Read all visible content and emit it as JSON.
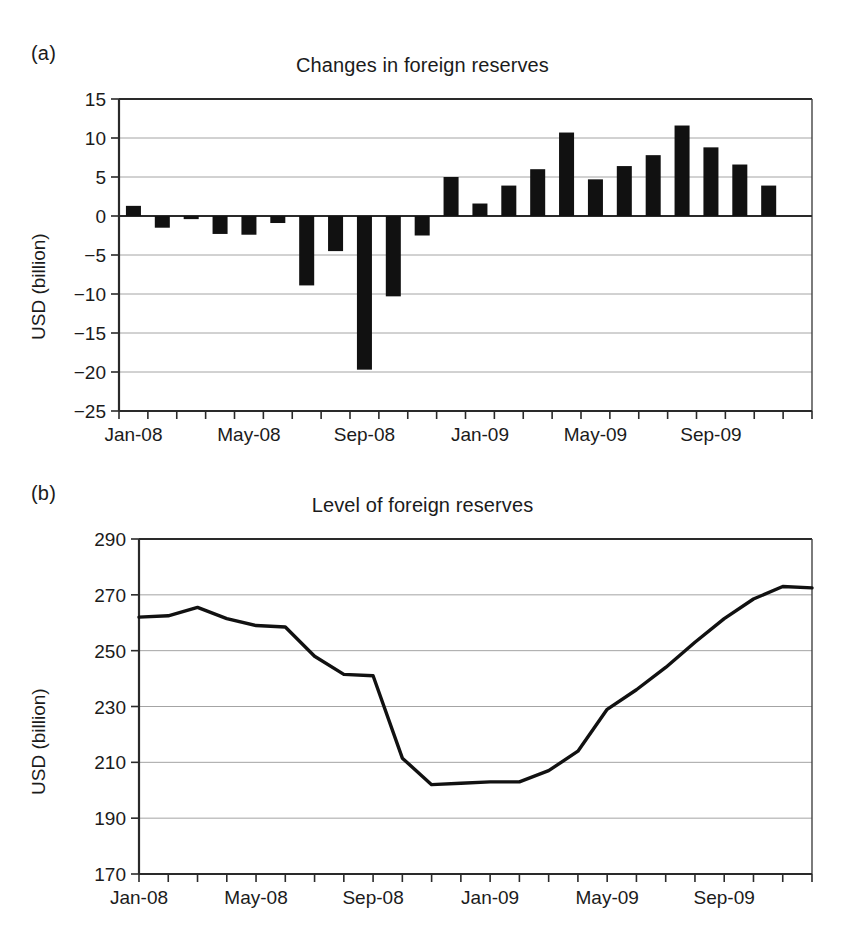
{
  "figure": {
    "panel_a_letter": "(a)",
    "panel_b_letter": "(b)"
  },
  "chart_data": [
    {
      "type": "bar",
      "panel": "(a)",
      "title": "Changes in foreign reserves",
      "xlabel": "",
      "ylabel": "USD (billion)",
      "ylim": [
        -25,
        15
      ],
      "yticks": [
        15,
        10,
        5,
        0,
        -5,
        -10,
        -15,
        -20,
        -25
      ],
      "ytick_labels": [
        "15",
        "10",
        "5",
        "0",
        "−5",
        "−10",
        "−15",
        "−20",
        "−25"
      ],
      "grid": true,
      "legend": "none",
      "xtick_labels": [
        "Jan-08",
        "May-08",
        "Sep-08",
        "Jan-09",
        "May-09",
        "Sep-09"
      ],
      "xtick_positions": [
        0,
        4,
        8,
        12,
        16,
        20
      ],
      "categories": [
        "Jan-08",
        "Feb-08",
        "Mar-08",
        "Apr-08",
        "May-08",
        "Jun-08",
        "Jul-08",
        "Aug-08",
        "Sep-08",
        "Oct-08",
        "Nov-08",
        "Dec-08",
        "Jan-09",
        "Feb-09",
        "Mar-09",
        "Apr-09",
        "May-09",
        "Jun-09",
        "Jul-09",
        "Aug-09",
        "Sep-09",
        "Oct-09",
        "Nov-09",
        "Dec-09"
      ],
      "values": [
        1.3,
        -1.5,
        -0.4,
        -2.3,
        -2.4,
        -0.9,
        -8.9,
        -4.5,
        -19.7,
        -10.3,
        -2.5,
        5.0,
        1.6,
        3.9,
        6.0,
        10.7,
        4.7,
        6.4,
        7.8,
        11.6,
        8.8,
        6.6,
        3.9,
        0.0
      ],
      "bars_count": 23
    },
    {
      "type": "line",
      "panel": "(b)",
      "title": "Level of foreign reserves",
      "xlabel": "",
      "ylabel": "USD (billion)",
      "ylim": [
        170,
        290
      ],
      "yticks": [
        290,
        270,
        250,
        230,
        210,
        190,
        170
      ],
      "ytick_labels": [
        "290",
        "270",
        "250",
        "230",
        "210",
        "190",
        "170"
      ],
      "grid": true,
      "legend": "none",
      "xtick_labels": [
        "Jan-08",
        "May-08",
        "Sep-08",
        "Jan-09",
        "May-09",
        "Sep-09"
      ],
      "xtick_positions": [
        0,
        4,
        8,
        12,
        16,
        20
      ],
      "x": [
        "Jan-08",
        "Feb-08",
        "Mar-08",
        "Apr-08",
        "May-08",
        "Jun-08",
        "Jul-08",
        "Aug-08",
        "Sep-08",
        "Oct-08",
        "Nov-08",
        "Dec-08",
        "Jan-09",
        "Feb-09",
        "Mar-09",
        "Apr-09",
        "May-09",
        "Jun-09",
        "Jul-09",
        "Aug-09",
        "Sep-09",
        "Oct-09",
        "Nov-09",
        "Dec-09"
      ],
      "values": [
        262.0,
        262.5,
        265.5,
        261.5,
        259.0,
        258.5,
        248.0,
        241.5,
        241.0,
        211.5,
        202.0,
        202.5,
        203.0,
        203.0,
        207.0,
        214.0,
        229.0,
        236.0,
        244.0,
        253.0,
        261.5,
        268.5,
        273.0,
        272.5
      ]
    }
  ]
}
